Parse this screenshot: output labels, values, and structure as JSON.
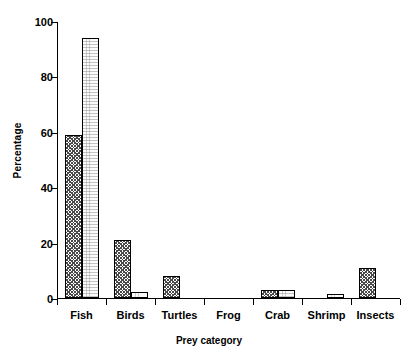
{
  "chart_data": {
    "type": "bar",
    "title": "",
    "xlabel": "Prey category",
    "ylabel": "Percentage",
    "categories": [
      "Fish",
      "Birds",
      "Turtles",
      "Frog",
      "Crab",
      "Shrimp",
      "Insects"
    ],
    "series": [
      {
        "name": "series-1",
        "pattern": "hatched",
        "values": [
          59,
          21,
          8,
          0,
          3,
          0,
          11
        ]
      },
      {
        "name": "series-2",
        "pattern": "stipple",
        "values": [
          94,
          2,
          0,
          0,
          3,
          1.5,
          0
        ]
      }
    ],
    "ylim": [
      0,
      100
    ],
    "yticks": [
      0,
      20,
      40,
      60,
      80,
      100
    ],
    "ytick_labels": [
      "0",
      "20",
      "40",
      "60",
      "80",
      "100"
    ],
    "grid": false,
    "legend": "none"
  }
}
